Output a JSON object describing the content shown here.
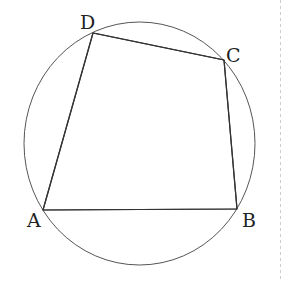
{
  "diagram": {
    "type": "cyclic-quadrilateral",
    "circle": {
      "cx": 139.5,
      "cy": 143.5,
      "rx": 115.5,
      "ry": 121.5,
      "stroke": "#555555"
    },
    "quadrilateral": {
      "stroke": "#333333",
      "vertices": [
        {
          "name": "A",
          "x": 43,
          "y": 210
        },
        {
          "name": "B",
          "x": 237,
          "y": 209
        },
        {
          "name": "C",
          "x": 224,
          "y": 60
        },
        {
          "name": "D",
          "x": 93,
          "y": 33
        }
      ]
    },
    "labels": {
      "A": "A",
      "B": "B",
      "C": "C",
      "D": "D"
    },
    "divider": {
      "x": 280.5,
      "stroke": "#cccccc"
    }
  }
}
